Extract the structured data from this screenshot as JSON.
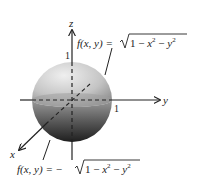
{
  "diagram": {
    "type": "unit-sphere-3d-axes",
    "axes": {
      "z_label": "z",
      "y_label": "y",
      "x_label": "x",
      "z_tick": "1",
      "y_tick": "1"
    },
    "upper_hemisphere": {
      "lhs": "f(x, y) = ",
      "radicand": "1 − x² − y²",
      "text": "f(x, y) = √(1 − x² − y²)"
    },
    "lower_hemisphere": {
      "lhs": "f(x, y) = −",
      "radicand": "1 − x² − y²",
      "text": "f(x, y) = −√(1 − x² − y²)"
    },
    "colors": {
      "sphere_light": "#e4e4e4",
      "sphere_mid": "#a8a8a8",
      "sphere_dark": "#3a3a3a",
      "axis": "#222222"
    }
  }
}
